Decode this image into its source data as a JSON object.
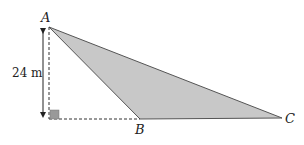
{
  "diagram": {
    "points": {
      "A": {
        "label": "A",
        "x": 49,
        "y": 27
      },
      "B": {
        "label": "B",
        "x": 140,
        "y": 119
      },
      "C": {
        "label": "C",
        "x": 282,
        "y": 118
      },
      "foot": {
        "x": 49,
        "y": 119
      }
    },
    "height_label": "24 m",
    "fill_color": "#c8c8c8",
    "stroke_color": "#555555",
    "right_angle_color": "#999999"
  }
}
